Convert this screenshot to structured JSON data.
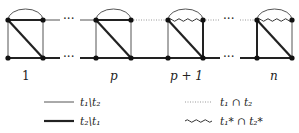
{
  "diagram": {
    "blocks": [
      {
        "label": "1",
        "x": 8,
        "top_edge": "thick",
        "arc": "thin",
        "wavy": false
      },
      {
        "label": "p",
        "x": 96,
        "top_edge": "thick",
        "arc": "thin",
        "wavy": false
      },
      {
        "label": "p + 1",
        "x": 168,
        "top_edge": "none",
        "arc": "thin",
        "wavy": true
      },
      {
        "label": "n",
        "x": 257,
        "top_edge": "none",
        "arc": "thin",
        "wavy": true
      }
    ],
    "ellipsis": "···",
    "labels": {
      "b1": "1",
      "b2": "p",
      "b3": "p + 1",
      "b4": "n"
    }
  },
  "legend": {
    "thin": {
      "style": "thin solid line",
      "label": "t₁\\t₂"
    },
    "thick": {
      "style": "thick solid line",
      "label": "t₂\\t₁"
    },
    "dotted": {
      "style": "dotted line",
      "label": "t₁ ∩ t₂"
    },
    "wavy": {
      "style": "wavy line",
      "label": "t₁* ∩ t₂*"
    }
  },
  "colors": {
    "ink": "#222222",
    "thin": "#555555",
    "dotted": "#999999"
  }
}
